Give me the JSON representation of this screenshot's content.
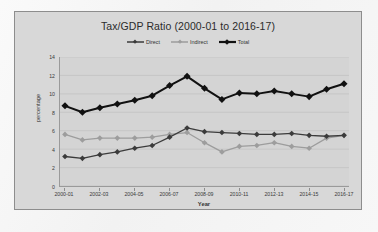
{
  "chart_data": {
    "type": "line",
    "title": "Tax/GDP Ratio (2000-01 to 2016-17)",
    "xlabel": "Year",
    "ylabel": "percentage",
    "grid": true,
    "legend_position": "top-center",
    "ylim": [
      0,
      14
    ],
    "yticks": [
      0,
      2,
      4,
      6,
      8,
      10,
      12,
      14
    ],
    "ytick_labels": [
      "0",
      "2",
      "4",
      "6",
      "8",
      "10",
      "12",
      "14"
    ],
    "x": [
      "2000-01",
      "2001-02",
      "2002-03",
      "2003-04",
      "2004-05",
      "2005-06",
      "2006-07",
      "2007-08",
      "2008-09",
      "2009-10",
      "2010-11",
      "2011-12",
      "2012-13",
      "2013-14",
      "2014-15",
      "2015-16",
      "2016-17"
    ],
    "xtick_labels": [
      "2000-01",
      "2002-03",
      "2004-05",
      "2006-07",
      "2008-09",
      "2010-11",
      "2012-13",
      "2014-15",
      "2016-17"
    ],
    "series": [
      {
        "name": "Direct",
        "color": "#3b3b3b",
        "values": [
          3.2,
          3.0,
          3.4,
          3.7,
          4.1,
          4.4,
          5.3,
          6.3,
          5.9,
          5.8,
          5.7,
          5.6,
          5.6,
          5.7,
          5.5,
          5.4,
          5.5
        ]
      },
      {
        "name": "Indirect",
        "color": "#9d9d9d",
        "values": [
          5.6,
          5.0,
          5.2,
          5.2,
          5.2,
          5.3,
          5.6,
          5.8,
          4.7,
          3.7,
          4.3,
          4.4,
          4.7,
          4.3,
          4.1,
          5.2,
          5.5
        ]
      },
      {
        "name": "Total",
        "color": "#111111",
        "values": [
          8.7,
          8.0,
          8.5,
          8.9,
          9.3,
          9.8,
          10.9,
          11.9,
          10.6,
          9.4,
          10.1,
          10.0,
          10.3,
          10.0,
          9.7,
          10.5,
          11.1
        ]
      }
    ]
  }
}
